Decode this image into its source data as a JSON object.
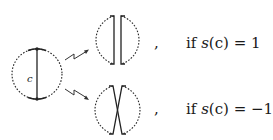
{
  "diagram": {
    "source_circle": {
      "chord_label": "c"
    },
    "cases": [
      {
        "separator": ",",
        "condition_prefix": "if ",
        "func": "s",
        "arg": "(c)",
        "relation": " = ",
        "value": "1",
        "result": "parallel-arcs"
      },
      {
        "separator": ",",
        "condition_prefix": "if ",
        "func": "s",
        "arg": "(c)",
        "relation": " = ",
        "value": "−1.",
        "result": "crossed-arcs"
      }
    ]
  }
}
